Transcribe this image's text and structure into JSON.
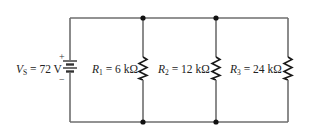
{
  "diagram": {
    "type": "parallel-resistor-circuit",
    "source": {
      "symbol": "V",
      "subscript": "S",
      "value_text": "= 72 V",
      "voltage": 72,
      "unit": "V",
      "plus_sign": "+",
      "minus_sign": "−"
    },
    "resistors": [
      {
        "symbol": "R",
        "subscript": "1",
        "value_text": "= 6 kΩ",
        "resistance_kohm": 6
      },
      {
        "symbol": "R",
        "subscript": "2",
        "value_text": "= 12 kΩ",
        "resistance_kohm": 12
      },
      {
        "symbol": "R",
        "subscript": "3",
        "value_text": "= 24 kΩ",
        "resistance_kohm": 24
      }
    ],
    "colors": {
      "wire": "#6e6e6e",
      "component": "#1a1a1a",
      "node": "#111111",
      "text": "#222222"
    }
  }
}
